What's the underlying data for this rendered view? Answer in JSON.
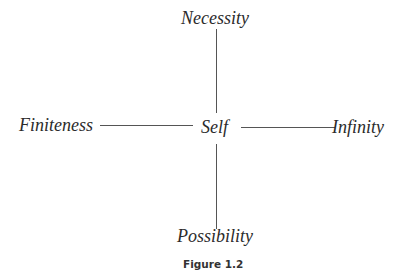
{
  "diagram": {
    "center": {
      "label": "Self"
    },
    "nodes": {
      "top": {
        "label": "Necessity"
      },
      "bottom": {
        "label": "Possibility"
      },
      "left": {
        "label": "Finiteness"
      },
      "right": {
        "label": "Infinity"
      }
    },
    "edges": [
      {
        "from": "Self",
        "to": "Necessity"
      },
      {
        "from": "Self",
        "to": "Possibility"
      },
      {
        "from": "Self",
        "to": "Finiteness"
      },
      {
        "from": "Self",
        "to": "Infinity"
      }
    ],
    "line_color": "#555555",
    "text_color": "#2b2b2b"
  },
  "caption": "Figure 1.2"
}
